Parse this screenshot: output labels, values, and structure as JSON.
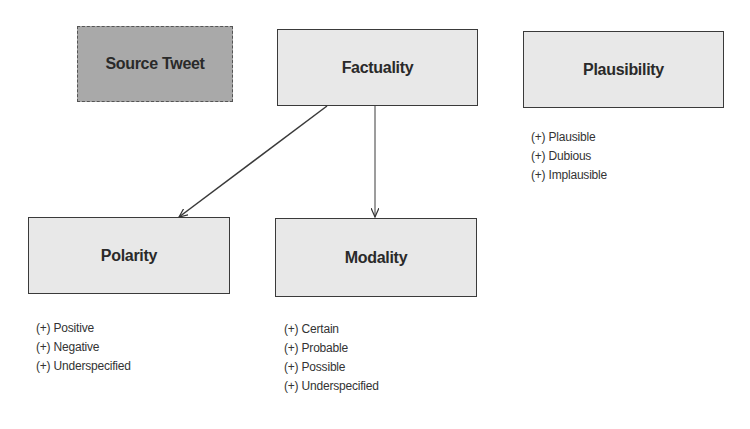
{
  "diagram": {
    "nodes": {
      "source_tweet": {
        "label": "Source Tweet",
        "style": "dashed",
        "fill": "#a9a9a9"
      },
      "factuality": {
        "label": "Factuality",
        "style": "solid",
        "fill": "#e8e8e8"
      },
      "plausibility": {
        "label": "Plausibility",
        "style": "solid",
        "fill": "#e8e8e8"
      },
      "polarity": {
        "label": "Polarity",
        "style": "solid",
        "fill": "#e8e8e8"
      },
      "modality": {
        "label": "Modality",
        "style": "solid",
        "fill": "#e8e8e8"
      }
    },
    "edges": [
      {
        "from": "Factuality",
        "to": "Polarity"
      },
      {
        "from": "Factuality",
        "to": "Modality"
      }
    ],
    "lists": {
      "plausibility": [
        "(+) Plausible",
        "(+) Dubious",
        "(+) Implausible"
      ],
      "polarity": [
        "(+) Positive",
        "(+) Negative",
        "(+) Underspecified"
      ],
      "modality": [
        "(+) Certain",
        "(+) Probable",
        "(+) Possible",
        "(+) Underspecified"
      ]
    }
  }
}
